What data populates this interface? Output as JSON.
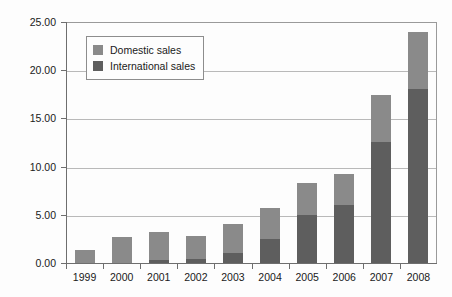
{
  "chart_data": {
    "type": "bar",
    "stacked": true,
    "title": "",
    "subtitle": "",
    "xlabel": "",
    "ylabel": "",
    "categories": [
      "1999",
      "2000",
      "2001",
      "2002",
      "2003",
      "2004",
      "2005",
      "2006",
      "2007",
      "2008"
    ],
    "series": [
      {
        "name": "Domestic sales",
        "color": "#8a8a8a",
        "values": [
          1.4,
          2.7,
          2.9,
          2.4,
          3.0,
          3.2,
          3.3,
          3.2,
          4.8,
          6.0
        ]
      },
      {
        "name": "International sales",
        "color": "#5e5e5e",
        "values": [
          0.0,
          0.0,
          0.3,
          0.4,
          1.0,
          2.5,
          5.0,
          6.0,
          12.6,
          18.0
        ]
      }
    ],
    "totals": [
      1.4,
      2.7,
      3.2,
      2.8,
      4.0,
      5.7,
      8.3,
      9.2,
      17.4,
      24.0
    ],
    "ylim": [
      0.0,
      25.0
    ],
    "y_ticks": [
      0.0,
      5.0,
      10.0,
      15.0,
      20.0,
      25.0
    ],
    "y_tick_labels": [
      "0.00",
      "5.00",
      "10.00",
      "15.00",
      "20.00",
      "25.00"
    ],
    "grid": true,
    "legend_position": "top-left"
  },
  "legend": {
    "items": [
      {
        "label": "Domestic sales",
        "color": "#8a8a8a"
      },
      {
        "label": "International sales",
        "color": "#5e5e5e"
      }
    ]
  },
  "colors": {
    "domestic": "#8a8a8a",
    "international": "#5e5e5e",
    "gridline": "#b9b9b9",
    "axis": "#6e6e6e",
    "background": "#fdfdfd",
    "text": "#1a1a1a"
  }
}
